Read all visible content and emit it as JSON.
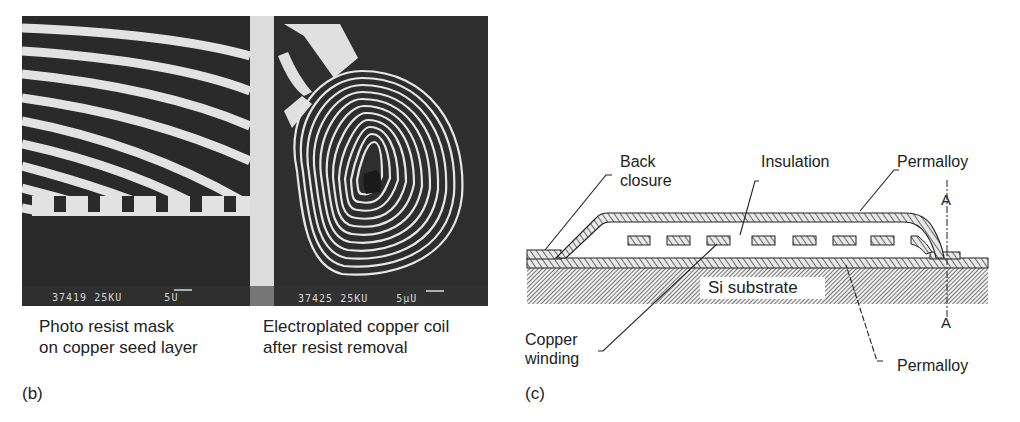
{
  "panel_b": {
    "label": "(b)",
    "left_image": {
      "caption_line1": "Photo resist mask",
      "caption_line2": "on copper seed layer",
      "sem_id": "37419",
      "sem_kv": "25KU",
      "sem_scale": "5U"
    },
    "right_image": {
      "caption_line1": "Electroplated copper coil",
      "caption_line2": "after resist removal",
      "sem_id": "37425",
      "sem_kv": "25KU",
      "sem_scale": "5µU"
    }
  },
  "panel_c": {
    "label": "(c)",
    "labels": {
      "back_closure_1": "Back",
      "back_closure_2": "closure",
      "insulation": "Insulation",
      "permalloy_top": "Permalloy",
      "permalloy_bottom": "Permalloy",
      "copper_winding_1": "Copper",
      "copper_winding_2": "winding",
      "substrate": "Si substrate",
      "section_top": "A",
      "section_bottom": "A"
    },
    "winding_count": 8
  },
  "colors": {
    "sem_background": "#2b2b2b",
    "sem_light": "#e6e6e6",
    "ink": "#222222"
  }
}
